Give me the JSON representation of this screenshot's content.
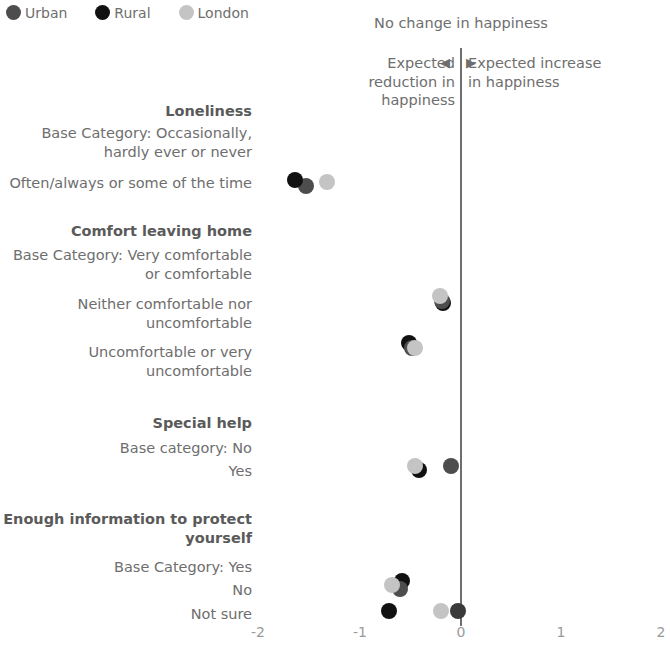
{
  "legend": {
    "items": [
      {
        "label": "Urban",
        "color": "#4d4d4d"
      },
      {
        "label": "Rural",
        "color": "#111111"
      },
      {
        "label": "London",
        "color": "#c4c4c4"
      }
    ]
  },
  "annotations": {
    "center": "No change in\nhappiness",
    "left": "Expected\nreduction in\nhappiness",
    "right": "Expected\nincrease in\nhappiness",
    "left_arrow": "◀",
    "right_arrow": "▶"
  },
  "axis": {
    "ticks": [
      "-2",
      "-1",
      "0",
      "1",
      "2"
    ],
    "tick_values": [
      -2,
      -1,
      0,
      1,
      2
    ],
    "xlim": [
      -2.08,
      2.08
    ]
  },
  "rows": [
    {
      "type": "group",
      "label": "Loneliness"
    },
    {
      "type": "base",
      "label": "Base Category: Occasionally,\nhardly ever or never"
    },
    {
      "type": "data",
      "label": "Often/always or some of the time"
    },
    {
      "type": "group",
      "label": "Comfort leaving home"
    },
    {
      "type": "base",
      "label": "Base Category: Very comfortable\nor comfortable"
    },
    {
      "type": "data",
      "label": "Neither comfortable nor\nuncomfortable"
    },
    {
      "type": "data",
      "label": "Uncomfortable or very\nuncomfortable"
    },
    {
      "type": "group",
      "label": "Special help"
    },
    {
      "type": "base",
      "label": "Base category: No"
    },
    {
      "type": "data",
      "label": "Yes"
    },
    {
      "type": "group",
      "label": "Enough information to protect\nyourself"
    },
    {
      "type": "base",
      "label": "Base Category: Yes"
    },
    {
      "type": "data",
      "label": "No"
    },
    {
      "type": "data",
      "label": "Not sure"
    }
  ],
  "chart_data": {
    "type": "scatter",
    "title": "",
    "xlabel": "",
    "ylabel": "",
    "xlim": [
      -2.08,
      2.08
    ],
    "grid": false,
    "legend_position": "top-left",
    "reference_line": {
      "x": 0,
      "label": "No change in happiness"
    },
    "groups": [
      {
        "group": "Loneliness",
        "base_category": "Base Category: Occasionally, hardly ever or never",
        "categories": [
          {
            "label": "Often/always or some of the time",
            "points": [
              {
                "series": "Urban",
                "value": -1.54
              },
              {
                "series": "Rural",
                "value": -1.65
              },
              {
                "series": "London",
                "value": -1.33
              }
            ]
          }
        ]
      },
      {
        "group": "Comfort leaving home",
        "base_category": "Base Category: Very comfortable or comfortable",
        "categories": [
          {
            "label": "Neither comfortable nor uncomfortable",
            "points": [
              {
                "series": "Urban",
                "value": -0.19
              },
              {
                "series": "Rural",
                "value": -0.17
              },
              {
                "series": "London",
                "value": -0.21
              }
            ]
          },
          {
            "label": "Uncomfortable or very uncomfortable",
            "points": [
              {
                "series": "Urban",
                "value": -0.48
              },
              {
                "series": "Rural",
                "value": -0.52
              },
              {
                "series": "London",
                "value": -0.46
              }
            ]
          }
        ]
      },
      {
        "group": "Special help",
        "base_category": "Base category: No",
        "categories": [
          {
            "label": "Yes",
            "points": [
              {
                "series": "Urban",
                "value": -0.1
              },
              {
                "series": "Rural",
                "value": -0.42
              },
              {
                "series": "London",
                "value": -0.46
              }
            ]
          }
        ]
      },
      {
        "group": "Enough information to protect yourself",
        "base_category": "Base Category: Yes",
        "categories": [
          {
            "label": "No",
            "points": [
              {
                "series": "Urban",
                "value": -0.62
              },
              {
                "series": "Rural",
                "value": -0.59
              },
              {
                "series": "London",
                "value": -0.69
              }
            ]
          },
          {
            "label": "Not sure",
            "points": [
              {
                "series": "Urban",
                "value": -0.04
              },
              {
                "series": "Rural",
                "value": -0.72
              },
              {
                "series": "London",
                "value": -0.2
              }
            ]
          }
        ]
      }
    ]
  }
}
